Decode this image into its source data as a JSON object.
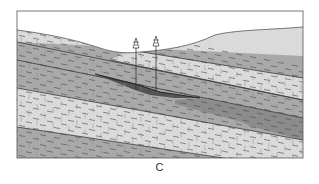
{
  "figure": {
    "caption": "C",
    "colors": {
      "sky": "#ffffff",
      "limestone": "#dcdcdc",
      "shale": "#a9a9a9",
      "reservoir_dark": "#5a5a5a",
      "reservoir_medium": "#8c8c8c",
      "line": "#3a3a3a",
      "frame": "#555555"
    },
    "layers": [
      {
        "name": "upper-limestone",
        "type": "limestone"
      },
      {
        "name": "upper-shale",
        "type": "shale"
      },
      {
        "name": "middle-limestone",
        "type": "limestone"
      },
      {
        "name": "lower-shale",
        "type": "shale"
      },
      {
        "name": "reservoir-wedge",
        "type": "reservoir"
      },
      {
        "name": "lower-limestone",
        "type": "limestone"
      },
      {
        "name": "basal-shale",
        "type": "shale"
      }
    ],
    "wells": [
      {
        "name": "well-1",
        "icon": "drilling-rig-icon"
      },
      {
        "name": "well-2",
        "icon": "drilling-rig-icon"
      }
    ]
  }
}
